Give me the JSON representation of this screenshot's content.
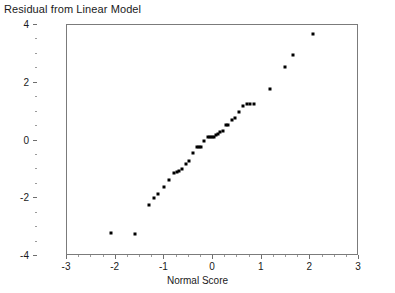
{
  "chart_data": {
    "type": "scatter",
    "title": "Residual from Linear Model",
    "xlabel": "Normal Score",
    "ylabel": "",
    "xlim": [
      -3,
      3
    ],
    "ylim": [
      -4,
      4
    ],
    "xticks": [
      -3,
      -2,
      -1,
      0,
      1,
      2,
      3
    ],
    "yticks": [
      -4,
      -2,
      0,
      2,
      4
    ],
    "xtick_labels": [
      "-3",
      "-2",
      "-1",
      "0",
      "1",
      "2",
      "3"
    ],
    "ytick_labels": [
      "-4",
      "-2",
      "0",
      "2",
      "4"
    ],
    "grid": false,
    "legend": null,
    "marker": "filled-square",
    "marker_color": "#000000",
    "series": [
      {
        "name": "Residuals",
        "points": [
          [
            -2.1,
            -3.22
          ],
          [
            -1.61,
            -3.25
          ],
          [
            -1.32,
            -2.25
          ],
          [
            -1.21,
            -2.0
          ],
          [
            -1.12,
            -1.86
          ],
          [
            -1.0,
            -1.6
          ],
          [
            -0.91,
            -1.38
          ],
          [
            -0.81,
            -1.12
          ],
          [
            -0.74,
            -1.09
          ],
          [
            -0.7,
            -1.06
          ],
          [
            -0.63,
            -1.0
          ],
          [
            -0.56,
            -0.83
          ],
          [
            -0.49,
            -0.7
          ],
          [
            -0.42,
            -0.45
          ],
          [
            -0.33,
            -0.23
          ],
          [
            -0.29,
            -0.22
          ],
          [
            -0.25,
            -0.23
          ],
          [
            -0.18,
            -0.03
          ],
          [
            -0.1,
            0.12
          ],
          [
            -0.06,
            0.12
          ],
          [
            -0.02,
            0.12
          ],
          [
            0.02,
            0.11
          ],
          [
            0.06,
            0.18
          ],
          [
            0.1,
            0.23
          ],
          [
            0.15,
            0.28
          ],
          [
            0.2,
            0.34
          ],
          [
            0.26,
            0.52
          ],
          [
            0.31,
            0.53
          ],
          [
            0.39,
            0.72
          ],
          [
            0.45,
            0.78
          ],
          [
            0.53,
            0.98
          ],
          [
            0.61,
            1.19
          ],
          [
            0.69,
            1.26
          ],
          [
            0.77,
            1.26
          ],
          [
            0.84,
            1.25
          ],
          [
            1.17,
            1.8
          ],
          [
            1.47,
            2.56
          ],
          [
            1.64,
            2.95
          ],
          [
            2.05,
            3.68
          ]
        ]
      }
    ]
  }
}
